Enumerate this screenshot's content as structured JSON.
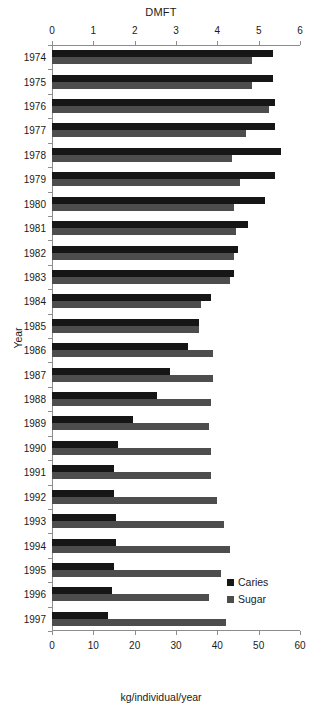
{
  "chart_data": {
    "type": "bar",
    "orientation": "horizontal",
    "title": "DMFT",
    "xlabel": "kg/individual/year",
    "ylabel": "Year",
    "top_axis": {
      "label": "DMFT",
      "ticks": [
        "0",
        "1",
        "2",
        "3",
        "4",
        "5",
        "6"
      ],
      "min": 0,
      "max": 6
    },
    "bottom_axis": {
      "label": "kg/individual/year",
      "ticks": [
        "0",
        "10",
        "20",
        "30",
        "40",
        "50",
        "60"
      ],
      "min": 0,
      "max": 60
    },
    "grid": false,
    "legend_position": "bottom-right",
    "legend": [
      {
        "name": "Caries",
        "color": "#161616"
      },
      {
        "name": "Sugar",
        "color": "#4d4d4d"
      }
    ],
    "categories": [
      "1974",
      "1975",
      "1976",
      "1977",
      "1978",
      "1979",
      "1980",
      "1981",
      "1982",
      "1983",
      "1984",
      "1985",
      "1986",
      "1987",
      "1988",
      "1989",
      "1990",
      "1991",
      "1992",
      "1993",
      "1994",
      "1995",
      "1996",
      "1997"
    ],
    "series": [
      {
        "name": "Caries",
        "axis": "top",
        "unit": "DMFT",
        "color": "#161616",
        "values": [
          5.35,
          5.35,
          5.4,
          5.4,
          5.55,
          5.4,
          5.15,
          4.75,
          4.5,
          4.4,
          3.85,
          3.55,
          3.3,
          2.85,
          2.55,
          1.95,
          1.6,
          1.5,
          1.5,
          1.55,
          1.55,
          1.5,
          1.45,
          1.35
        ]
      },
      {
        "name": "Sugar",
        "axis": "bottom",
        "unit": "kg/individual/year",
        "color": "#4d4d4d",
        "values": [
          48.5,
          48.5,
          52.5,
          47.0,
          43.5,
          45.5,
          44.0,
          44.5,
          44.0,
          43.0,
          36.0,
          35.5,
          39.0,
          39.0,
          38.5,
          38.0,
          38.5,
          38.5,
          40.0,
          41.5,
          43.0,
          41.0,
          38.0,
          42.0
        ]
      }
    ]
  }
}
